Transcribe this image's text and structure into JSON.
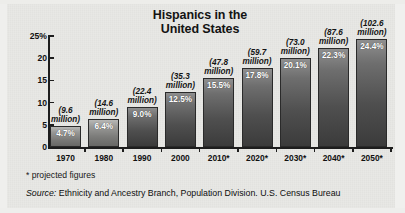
{
  "chart_data": {
    "type": "bar",
    "title": "Hispanics in the United States",
    "title_line1": "Hispanics in the",
    "title_line2": "United States",
    "xlabel": "",
    "ylabel": "",
    "ylim": [
      0,
      25
    ],
    "grid": false,
    "legend": "none",
    "yticks": [
      "25%",
      "20",
      "15",
      "10",
      "5",
      "0"
    ],
    "ytick_values": [
      25,
      20,
      15,
      10,
      5,
      0
    ],
    "categories": [
      "1970",
      "1980",
      "1990",
      "2000",
      "2010*",
      "2020*",
      "2030*",
      "2040*",
      "2050*"
    ],
    "values": [
      4.7,
      6.4,
      9.0,
      12.5,
      15.5,
      17.8,
      20.1,
      22.3,
      24.4
    ],
    "value_labels": [
      "4.7%",
      "6.4%",
      "9.0%",
      "12.5%",
      "15.5%",
      "17.8%",
      "20.1%",
      "22.3%",
      "24.4%"
    ],
    "annotations": [
      "(9.6 million)",
      "(14.6 million)",
      "(22.4 million)",
      "(35.3 million)",
      "(47.8 million)",
      "(59.7 million)",
      "(73.0 million)",
      "(87.6 million)",
      "(102.6 million)"
    ],
    "annotation_lines": [
      [
        "(9.6",
        "million)"
      ],
      [
        "(14.6",
        "million)"
      ],
      [
        "(22.4",
        "million)"
      ],
      [
        "(35.3",
        "million)"
      ],
      [
        "(47.8",
        "million)"
      ],
      [
        "(59.7",
        "million)"
      ],
      [
        "(73.0",
        "million)"
      ],
      [
        "(87.6",
        "million)"
      ],
      [
        "(102.6",
        "million)"
      ]
    ],
    "population_millions": [
      9.6,
      14.6,
      22.4,
      35.3,
      47.8,
      59.7,
      73.0,
      87.6,
      102.6
    ],
    "projected_from": "2010*"
  },
  "footnote": "* projected figures",
  "source": {
    "label": "Source:",
    "text": "Ethnicity and Ancestry Branch, Population Division. U.S. Census Bureau"
  }
}
